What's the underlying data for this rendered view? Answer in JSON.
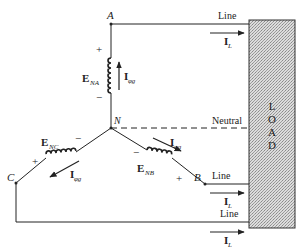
{
  "diagram": {
    "type": "Y-connected three-phase generator with load",
    "nodes": {
      "A": "A",
      "B": "B",
      "C": "C",
      "N": "N"
    },
    "sources": {
      "ena": {
        "label": "E",
        "sub": "NA",
        "plus": "+",
        "minus": "−"
      },
      "enb": {
        "label": "E",
        "sub": "NB",
        "plus": "+",
        "minus": "−"
      },
      "enc": {
        "label": "E",
        "sub": "NC",
        "plus": "+",
        "minus": "−"
      }
    },
    "phase_current": {
      "label": "I",
      "sub": "φg"
    },
    "line_current": {
      "label": "I",
      "sub": "L"
    },
    "lines": {
      "line_a": "Line",
      "line_b": "Line",
      "line_c": "Line",
      "neutral": "Neutral"
    },
    "load": {
      "letters": [
        "L",
        "O",
        "A",
        "D"
      ]
    },
    "colors": {
      "stroke": "#222222",
      "load_fill": "#c8c8c8"
    }
  }
}
